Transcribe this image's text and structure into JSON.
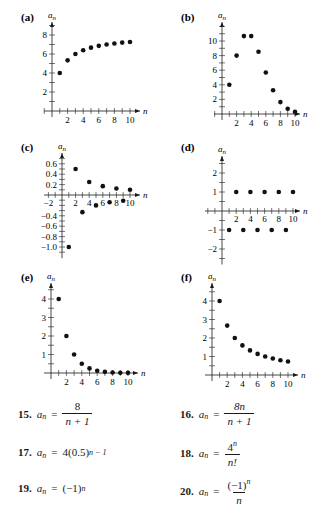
{
  "chart_data": [
    {
      "id": "a",
      "label": "(a)",
      "type": "scatter",
      "xlabel": "n",
      "ylabel": "a_n",
      "x": [
        1,
        2,
        3,
        4,
        5,
        6,
        7,
        8,
        9,
        10
      ],
      "values": [
        4,
        5.33,
        6,
        6.4,
        6.67,
        6.86,
        7,
        7.11,
        7.2,
        7.27
      ],
      "xticks": [
        2,
        4,
        6,
        8,
        10
      ],
      "yticks": [
        2,
        4,
        6,
        8
      ],
      "ylim": [
        0,
        9
      ],
      "grid": false
    },
    {
      "id": "b",
      "label": "(b)",
      "type": "scatter",
      "xlabel": "n",
      "ylabel": "a_n",
      "x": [
        1,
        2,
        3,
        4,
        5,
        6,
        7,
        8,
        9,
        10
      ],
      "values": [
        4,
        8,
        10.67,
        10.67,
        8.53,
        5.69,
        3.25,
        1.63,
        0.72,
        0.29
      ],
      "xticks": [
        2,
        4,
        6,
        8,
        10
      ],
      "yticks": [
        2,
        4,
        6,
        8,
        10
      ],
      "ylim": [
        0,
        12
      ],
      "grid": false
    },
    {
      "id": "c",
      "label": "(c)",
      "type": "scatter",
      "xlabel": "n",
      "ylabel": "a_n",
      "x": [
        1,
        2,
        3,
        4,
        5,
        6,
        7,
        8,
        9,
        10
      ],
      "values": [
        -1,
        0.5,
        -0.33,
        0.25,
        -0.2,
        0.17,
        -0.14,
        0.125,
        -0.11,
        0.1
      ],
      "xticks": [
        -2,
        2,
        4,
        6,
        8,
        10
      ],
      "yticks": [
        0.6,
        0.4,
        0.2,
        -0.4,
        -0.6,
        -0.8,
        -1.0
      ],
      "ytick_labels": [
        "0.6",
        "0.4",
        "0.2",
        "−0.4",
        "−0.6",
        "−0.8",
        "−1.0"
      ],
      "xtick_labels": [
        "−2",
        "2",
        "4",
        "6",
        "8",
        "10"
      ],
      "ylim": [
        -1.1,
        0.75
      ],
      "grid": false
    },
    {
      "id": "d",
      "label": "(d)",
      "type": "scatter",
      "xlabel": "n",
      "ylabel": "a_n",
      "x": [
        1,
        2,
        3,
        4,
        5,
        6,
        7,
        8,
        9,
        10
      ],
      "values": [
        -1,
        1,
        -1,
        1,
        -1,
        1,
        -1,
        1,
        -1,
        1
      ],
      "xticks": [
        2,
        4,
        6,
        8,
        10
      ],
      "yticks": [
        2,
        1,
        -1,
        -2
      ],
      "ytick_labels": [
        "2",
        "1",
        "−1",
        "−2"
      ],
      "ylim": [
        -2.5,
        2.8
      ],
      "grid": false
    },
    {
      "id": "e",
      "label": "(e)",
      "type": "scatter",
      "xlabel": "n",
      "ylabel": "a_n",
      "x": [
        1,
        2,
        3,
        4,
        5,
        6,
        7,
        8,
        9,
        10
      ],
      "values": [
        4,
        2,
        1,
        0.5,
        0.25,
        0.125,
        0.0625,
        0.031,
        0.016,
        0.008
      ],
      "xticks": [
        2,
        4,
        6,
        8,
        10
      ],
      "yticks": [
        1,
        2,
        3,
        4
      ],
      "ylim": [
        0,
        4.8
      ],
      "grid": false
    },
    {
      "id": "f",
      "label": "(f)",
      "type": "scatter",
      "xlabel": "n",
      "ylabel": "a_n",
      "x": [
        1,
        2,
        3,
        4,
        5,
        6,
        7,
        8,
        9,
        10
      ],
      "values": [
        4,
        2.67,
        2,
        1.6,
        1.33,
        1.14,
        1,
        0.89,
        0.8,
        0.73
      ],
      "xticks": [
        2,
        4,
        6,
        8,
        10
      ],
      "yticks": [
        1,
        2,
        3,
        4
      ],
      "ylim": [
        0,
        4.8
      ],
      "grid": false
    }
  ],
  "exercises": [
    {
      "num": "15.",
      "lhs": "a",
      "sub": "n",
      "rhs_top": "8",
      "rhs_bot": "n + 1"
    },
    {
      "num": "16.",
      "lhs": "a",
      "sub": "n",
      "rhs_top": "8n",
      "rhs_bot": "n + 1"
    },
    {
      "num": "17.",
      "lhs": "a",
      "sub": "n",
      "rhs": "4(0.5)",
      "rhs_sup": "n − 1"
    },
    {
      "num": "18.",
      "lhs": "a",
      "sub": "n",
      "rhs_top": "4",
      "rhs_top_sup": "n",
      "rhs_bot": "n!"
    },
    {
      "num": "19.",
      "lhs": "a",
      "sub": "n",
      "rhs": "(−1)",
      "rhs_sup": "n"
    },
    {
      "num": "20.",
      "lhs": "a",
      "sub": "n",
      "rhs_top": "(−1)",
      "rhs_top_sup": "n",
      "rhs_bot": "n"
    }
  ]
}
